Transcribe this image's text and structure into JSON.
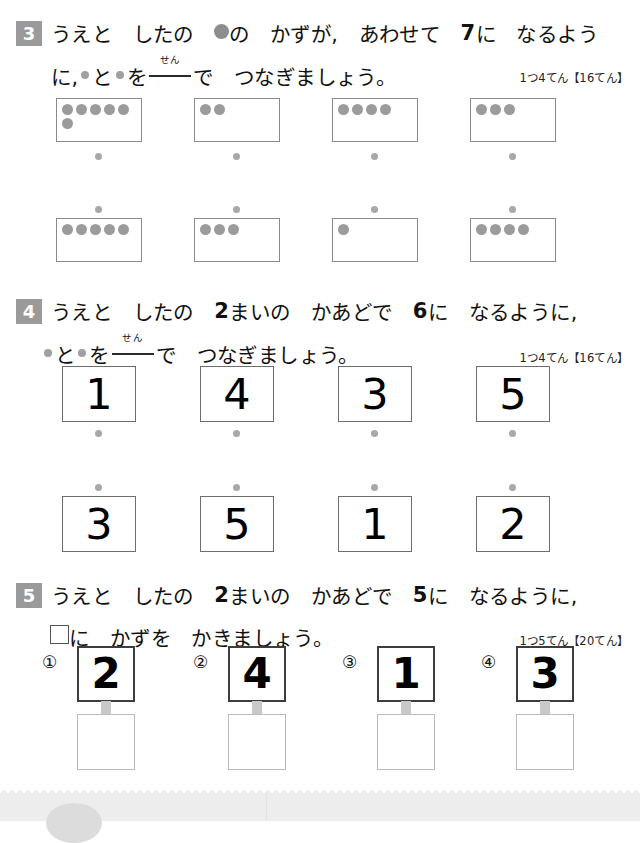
{
  "worksheet": {
    "problems": [
      {
        "number": "3",
        "line1_pre": "うえと　したの　",
        "line1_post": "の　かずが,　あわせて　",
        "line1_num": "7",
        "line1_tail": "に　なるよう",
        "line2_a": "に,",
        "line2_b": "と",
        "line2_c": "を",
        "ruby": "せん",
        "line2_d": "で　つなぎましょう。",
        "score": "1つ4てん【16てん】",
        "top_row_dots": [
          6,
          2,
          4,
          3
        ],
        "bottom_row_dots": [
          5,
          3,
          1,
          4
        ]
      },
      {
        "number": "4",
        "line1_a": "うえと　したの　",
        "line1_num1": "2",
        "line1_b": "まいの　かあどで　",
        "line1_num2": "6",
        "line1_c": "に　なるように,",
        "line2_b": "と",
        "line2_c": "を",
        "ruby": "せん",
        "line2_d": "で　つなぎましょう。",
        "score": "1つ4てん【16てん】",
        "top_row_values": [
          "1",
          "4",
          "3",
          "5"
        ],
        "bottom_row_values": [
          "3",
          "5",
          "1",
          "2"
        ]
      },
      {
        "number": "5",
        "line1_a": "うえと　したの　",
        "line1_num1": "2",
        "line1_b": "まいの　かあどで　",
        "line1_num2": "5",
        "line1_c": "に　なるように,",
        "line2_a": "に　かずを　かきましょう。",
        "score": "1つ5てん【20てん】",
        "items": [
          {
            "label": "①",
            "value": "2",
            "answer": ""
          },
          {
            "label": "②",
            "value": "4",
            "answer": ""
          },
          {
            "label": "③",
            "value": "1",
            "answer": ""
          },
          {
            "label": "④",
            "value": "3",
            "answer": ""
          }
        ]
      }
    ],
    "colors": {
      "badge_gray": "#9a9a9a",
      "dot_gray": "#9b9b9b",
      "connector_gray": "#a8a8a8",
      "box_border": "#8a8a8a",
      "card_border": "#6d6d6d",
      "answer_border": "#bcbcbc",
      "footer_gray": "#ededed"
    }
  }
}
